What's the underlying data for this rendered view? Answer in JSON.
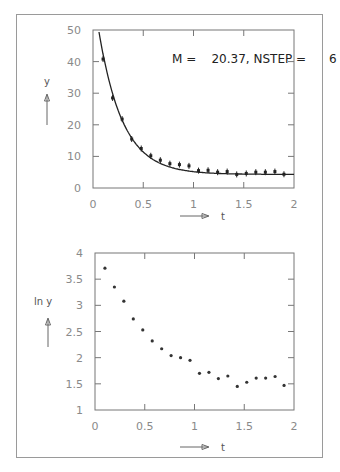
{
  "chart_data": [
    {
      "type": "scatter",
      "title": "",
      "annotation": "M =    20.37, NSTEP =      6",
      "xlabel": "t",
      "ylabel": "y",
      "xlim": [
        0,
        2
      ],
      "ylim": [
        0,
        50
      ],
      "xticks": [
        "0",
        "0.5",
        "1",
        "1.5",
        "2"
      ],
      "yticks": [
        "0",
        "10",
        "20",
        "30",
        "40",
        "50"
      ],
      "grid": false,
      "series": [
        {
          "name": "measurements",
          "style": "points-with-error-bars",
          "x": [
            0.1,
            0.195,
            0.29,
            0.385,
            0.48,
            0.575,
            0.67,
            0.765,
            0.86,
            0.955,
            1.05,
            1.145,
            1.24,
            1.335,
            1.43,
            1.525,
            1.62,
            1.715,
            1.81,
            1.9
          ],
          "y": [
            40.8,
            28.5,
            21.8,
            15.5,
            12.5,
            10.2,
            8.8,
            7.7,
            7.4,
            7.0,
            5.5,
            5.6,
            5.0,
            5.2,
            4.3,
            4.6,
            5.0,
            5.0,
            5.2,
            4.35
          ]
        },
        {
          "name": "fit",
          "style": "line",
          "function": "y = 4.3 + 58*exp(-4.2*t)"
        }
      ]
    },
    {
      "type": "scatter",
      "title": "",
      "xlabel": "t",
      "ylabel": "ln y",
      "xlim": [
        0,
        2
      ],
      "ylim": [
        1,
        4
      ],
      "xticks": [
        "0",
        "0.5",
        "1",
        "1.5",
        "2"
      ],
      "yticks": [
        "1",
        "1.5",
        "2",
        "2.5",
        "3",
        "3.5",
        "4"
      ],
      "grid": false,
      "series": [
        {
          "name": "ln y",
          "style": "points",
          "x": [
            0.1,
            0.195,
            0.29,
            0.385,
            0.48,
            0.575,
            0.67,
            0.765,
            0.86,
            0.955,
            1.05,
            1.145,
            1.24,
            1.335,
            1.43,
            1.525,
            1.62,
            1.715,
            1.81,
            1.9
          ],
          "y": [
            3.71,
            3.35,
            3.08,
            2.74,
            2.53,
            2.32,
            2.17,
            2.04,
            2.0,
            1.95,
            1.7,
            1.72,
            1.6,
            1.65,
            1.45,
            1.53,
            1.61,
            1.61,
            1.64,
            1.47
          ]
        }
      ]
    }
  ],
  "labels": {
    "top_annotation": "M =    20.37, NSTEP =      6",
    "top_ylabel": "y",
    "top_xlabel": "t",
    "bottom_ylabel": "ln y",
    "bottom_xlabel": "t"
  }
}
